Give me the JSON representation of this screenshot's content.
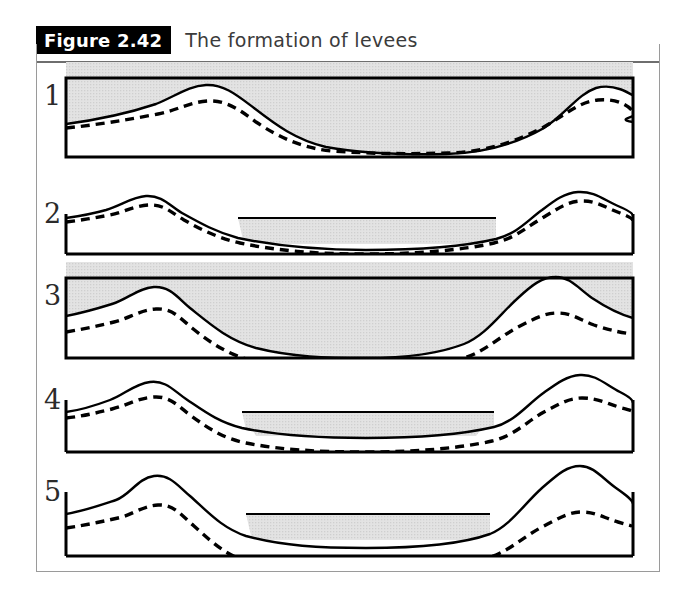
{
  "figure": {
    "tag": "Figure 2.42",
    "caption": "The formation of levees",
    "accent_black": "#000000",
    "frame_color": "#9a9a9a",
    "water_fill": "#e3e3e3",
    "line_color": "#000000"
  },
  "panels": [
    {
      "number": "1",
      "stage": "flood-overtopping-banks",
      "box": {
        "x": 66,
        "y": 78,
        "w": 567,
        "h": 79,
        "top_border": true
      },
      "ground_profile": "M0,46 C30,42 60,36 90,26 C110,18 122,8 140,7 C158,6 172,18 188,30 C210,47 230,62 260,69 C300,76 340,77 380,76 C420,75 450,66 478,50 C500,36 512,16 530,10 C548,5 562,14 578,24 C598,36 540,40 567,44 L567,44",
      "previous_profile": "M0,50 C30,47 60,42 92,36 C112,32 124,24 142,23 C160,22 174,32 190,44 C214,60 236,70 266,73 C306,76 342,76 382,75 C420,74 448,64 476,50 C498,38 512,24 532,22 C550,20 564,28 567,34",
      "water": {
        "mode": "above-ground-to-top"
      }
    },
    {
      "number": "2",
      "stage": "normal-flow-in-channel",
      "box": {
        "x": 66,
        "y": 196,
        "w": 567,
        "h": 58,
        "top_border": false
      },
      "ground_profile": "M0,22 C14,20 26,18 40,14 C56,9 66,1 80,0 C96,-1 104,10 116,17 C134,27 150,36 172,42 C210,50 250,54 300,54 C350,54 400,50 430,43 C452,37 462,24 476,14 C488,5 498,-3 512,-4 C528,-5 538,4 552,10 C564,15 567,18 567,20",
      "previous_profile": "M0,26 C16,24 28,22 44,19 C58,16 68,10 82,9 C98,8 106,17 118,24 C136,34 152,42 174,47 C212,55 252,58 300,58 C350,58 398,54 428,47 C450,42 462,30 478,21 C490,14 500,6 514,5 C530,4 540,12 554,17 C564,21 567,23 567,25",
      "water": {
        "mode": "channel-only",
        "surface_y": 22,
        "left_x": 172,
        "right_x": 430
      }
    },
    {
      "number": "3",
      "stage": "second-flood-overtopping",
      "box": {
        "x": 66,
        "y": 278,
        "w": 567,
        "h": 80,
        "top_border": true
      },
      "ground_profile": "M0,38 C16,35 30,31 46,26 C62,21 72,10 88,9 C104,8 112,20 124,30 C144,46 162,62 190,70 C226,79 260,80 300,80 C340,80 372,76 398,66 C420,57 434,36 452,20 C466,7 476,-1 490,-1 C504,-1 512,10 526,20 C544,32 556,37 567,40",
      "previous_profile": "M0,54 C18,51 32,48 48,44 C64,40 74,32 90,31 C106,30 114,40 126,50 C146,66 164,78 192,84 C228,90 262,91 300,91 C340,91 372,88 398,80 C420,73 434,58 454,48 C468,41 478,35 492,35 C506,35 514,42 528,47 C546,53 558,55 567,56",
      "water": {
        "mode": "above-ground-to-top"
      }
    },
    {
      "number": "4",
      "stage": "normal-flow-higher-levees",
      "box": {
        "x": 66,
        "y": 382,
        "w": 567,
        "h": 70,
        "top_border": false
      },
      "ground_profile": "M0,30 C16,28 28,24 44,18 C58,13 68,2 84,0 C100,-2 108,9 120,17 C138,29 152,40 176,46 C214,54 252,56 300,56 C350,56 398,52 428,45 C448,40 460,24 476,12 C490,2 500,-6 514,-7 C530,-8 540,3 554,10 C564,15 567,18 567,21",
      "previous_profile": "M0,36 C18,34 30,31 46,27 C62,23 72,16 88,15 C104,14 112,24 124,33 C142,46 156,56 180,61 C216,68 254,70 300,70 C350,70 396,66 426,59 C448,54 460,40 478,30 C492,23 502,16 516,16 C532,16 542,22 556,26 C564,28 567,29 567,30",
      "water": {
        "mode": "channel-only",
        "surface_y": 30,
        "left_x": 176,
        "right_x": 428
      }
    },
    {
      "number": "5",
      "stage": "normal-flow-highest-levees",
      "box": {
        "x": 66,
        "y": 474,
        "w": 567,
        "h": 82,
        "top_border": false
      },
      "ground_profile": "M0,40 C18,37 32,32 50,26 C64,21 72,4 88,2 C104,0 112,12 124,22 C142,38 156,54 180,62 C216,72 254,74 300,74 C350,74 396,70 424,60 C444,52 458,30 476,14 C490,2 500,-8 514,-8 C528,-8 536,4 550,14 C560,21 567,26 567,30",
      "previous_profile": "M0,54 C20,51 34,48 52,44 C66,41 76,32 92,31 C108,30 116,42 128,52 C146,68 160,82 184,88 C220,96 256,98 300,98 C350,98 394,93 422,84 C444,77 458,62 478,52 C492,45 502,38 516,38 C530,38 538,44 552,48 C562,51 567,52 567,53",
      "water": {
        "mode": "channel-only",
        "surface_y": 40,
        "left_x": 180,
        "right_x": 424
      }
    }
  ]
}
